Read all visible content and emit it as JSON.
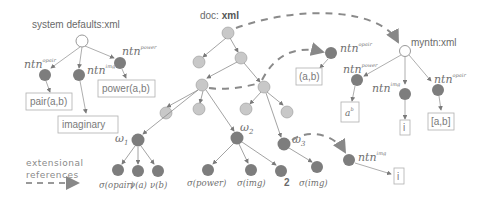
{
  "title_labels": {
    "system_defaults": "system defaults:xml",
    "doc_prefix": "doc: ",
    "doc_bold": "xml",
    "myntn": "myntn:xml"
  },
  "ntn_labels": {
    "base": "ntn",
    "sys_opair": "opair",
    "sys_img": "img",
    "sys_power": "power",
    "doc_opair": "opair",
    "my_power": "power",
    "my_img": "img",
    "my_opair": "opair",
    "ext_img": "img"
  },
  "boxes": {
    "pair": "pair(a,b)",
    "power": "power(a,b)",
    "imaginary": "imaginary",
    "ab_paren": "(a,b)",
    "a_pow_b": "a",
    "a_pow_b_sup": "b",
    "i_my": "i",
    "ab_bracket": "[a,b]",
    "i_ext": "i"
  },
  "omega_labels": {
    "w1": "ω",
    "w1_sub": "1",
    "w2": "ω",
    "w2_sub": "2",
    "w3": "ω",
    "w3_sub": "3"
  },
  "leaf_labels": {
    "sigma_opair": "σ(opair)",
    "nu_a": "ν(a)",
    "nu_b": "ν(b)",
    "sigma_power": "σ(power)",
    "sigma_img_1": "σ(img)",
    "two": "2",
    "sigma_img_2": "σ(img)"
  },
  "legend": {
    "line1": "extensional",
    "line2": "references"
  },
  "colors": {
    "dark_node": "#7d7d7d",
    "light_node": "#c8c8c8",
    "edge": "#8c8c8c",
    "dashed": "#8a8a8a",
    "box_border": "#b0b0b0"
  }
}
